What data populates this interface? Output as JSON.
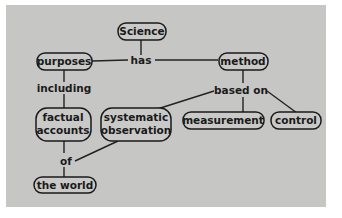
{
  "diagram": {
    "type": "concept-map",
    "background_color": "#c6c6c4",
    "nodes": {
      "science": "Science",
      "purposes": "purposes",
      "method": "method",
      "factual_l1": "factual",
      "factual_l2": "accounts",
      "systematic_l1": "systematic",
      "systematic_l2": "observation",
      "measurement": "measurement",
      "control": "control",
      "world": "the world"
    },
    "links": {
      "has": "has",
      "including": "including",
      "based_on": "based on",
      "of": "of"
    }
  }
}
